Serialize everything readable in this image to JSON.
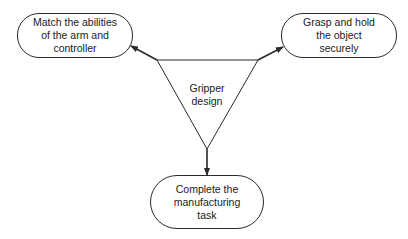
{
  "diagram": {
    "center": {
      "label": "Gripper\ndesign"
    },
    "nodes": [
      {
        "id": "left",
        "label": "Match the abilities\nof the arm and\ncontroller"
      },
      {
        "id": "right",
        "label": "Grasp and hold\nthe object\nsecurely"
      },
      {
        "id": "bottom",
        "label": "Complete the\nmanufacturing\ntask"
      }
    ],
    "edges": [
      {
        "from": "center",
        "to": "left"
      },
      {
        "from": "center",
        "to": "right"
      },
      {
        "from": "center",
        "to": "bottom"
      }
    ],
    "colors": {
      "stroke": "#2a2a2a",
      "background": "#ffffff",
      "text": "#1a1a1a"
    }
  }
}
